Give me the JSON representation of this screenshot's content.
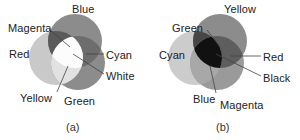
{
  "figure": {
    "background": "#ffffff",
    "text_color": "#222222",
    "panels": [
      {
        "id": "a",
        "caption": "(a)",
        "model": "additive",
        "circles": [
          {
            "name": "red",
            "label": "Red",
            "fill": "#c9c9c9"
          },
          {
            "name": "green",
            "label": "Green",
            "fill": "#8c8c8c"
          },
          {
            "name": "blue",
            "label": "Blue",
            "fill": "#8c8c8c"
          }
        ],
        "overlaps": [
          {
            "name": "magenta",
            "label": "Magenta",
            "fill": "#5a5a5a"
          },
          {
            "name": "cyan",
            "label": "Cyan",
            "fill": "#6d6d6d"
          },
          {
            "name": "yellow",
            "label": "Yellow",
            "fill": "#e2e2e2"
          },
          {
            "name": "white",
            "label": "White",
            "fill": "#fcfcfc"
          }
        ],
        "labels": [
          {
            "name": "blue",
            "text": "Blue",
            "x": 72,
            "y": 3,
            "leader": false
          },
          {
            "name": "magenta",
            "text": "Magenta",
            "x": 8,
            "y": 22,
            "leader": true
          },
          {
            "name": "red",
            "text": "Red",
            "x": 9,
            "y": 48,
            "leader": false
          },
          {
            "name": "cyan",
            "text": "Cyan",
            "x": 106,
            "y": 49,
            "leader": true
          },
          {
            "name": "white",
            "text": "White",
            "x": 106,
            "y": 70,
            "leader": true
          },
          {
            "name": "yellow",
            "text": "Yellow",
            "x": 20,
            "y": 92,
            "leader": true
          },
          {
            "name": "green",
            "text": "Green",
            "x": 64,
            "y": 95,
            "leader": false
          }
        ]
      },
      {
        "id": "b",
        "caption": "(b)",
        "model": "subtractive",
        "circles": [
          {
            "name": "yellow",
            "label": "Yellow",
            "fill": "#8c8c8c"
          },
          {
            "name": "cyan",
            "label": "Cyan",
            "fill": "#cccccc"
          },
          {
            "name": "magenta",
            "label": "Magenta",
            "fill": "#9a9a9a"
          }
        ],
        "overlaps": [
          {
            "name": "green",
            "label": "Green",
            "fill": "#474747"
          },
          {
            "name": "red",
            "label": "Red",
            "fill": "#5e5e5e"
          },
          {
            "name": "blue",
            "label": "Blue",
            "fill": "#a8a8a8"
          },
          {
            "name": "black",
            "label": "Black",
            "fill": "#111111"
          }
        ],
        "labels": [
          {
            "name": "yellow",
            "text": "Yellow",
            "x": 74,
            "y": 3,
            "leader": false
          },
          {
            "name": "green",
            "text": "Green",
            "x": 22,
            "y": 22,
            "leader": true
          },
          {
            "name": "cyan",
            "text": "Cyan",
            "x": 9,
            "y": 49,
            "leader": false
          },
          {
            "name": "red",
            "text": "Red",
            "x": 113,
            "y": 51,
            "leader": true
          },
          {
            "name": "black",
            "text": "Black",
            "x": 113,
            "y": 72,
            "leader": true
          },
          {
            "name": "blue",
            "text": "Blue",
            "x": 43,
            "y": 93,
            "leader": true
          },
          {
            "name": "magenta",
            "text": "Magenta",
            "x": 70,
            "y": 99,
            "leader": false
          }
        ]
      }
    ],
    "captions": [
      {
        "name": "caption-a",
        "text": "(a)",
        "x": 66,
        "y": 121
      },
      {
        "name": "caption-b",
        "text": "(b)",
        "x": 216,
        "y": 121
      }
    ]
  }
}
